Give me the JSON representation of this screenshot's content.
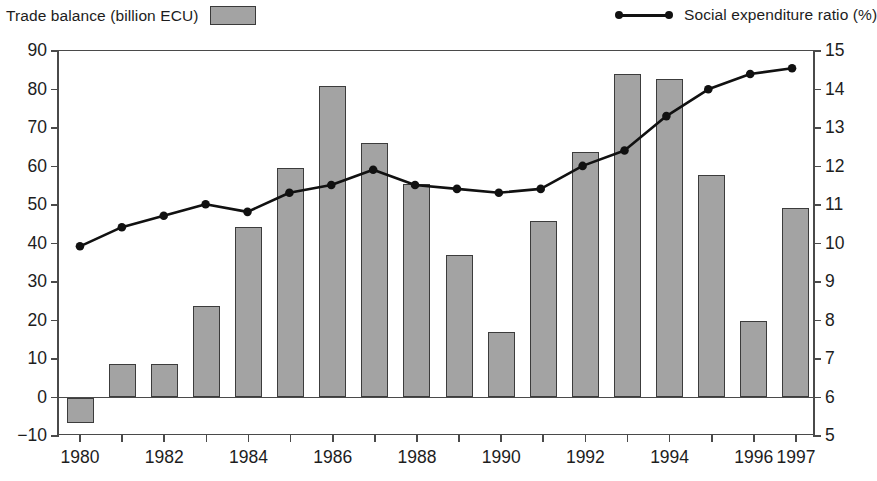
{
  "legend": {
    "bar": {
      "label": "Trade balance (billion ECU)",
      "swatch_icon": "gray-rectangle-swatch",
      "color": "#a3a3a3"
    },
    "line": {
      "label": "Social expenditure ratio (%)",
      "symbol_icon": "line-with-dots-symbol",
      "color": "#111111"
    }
  },
  "axes": {
    "left": {
      "ticks": [
        "90",
        "80",
        "70",
        "60",
        "50",
        "40",
        "30",
        "20",
        "10",
        "0",
        "−10"
      ],
      "min": -10,
      "max": 90,
      "step": 10
    },
    "right": {
      "ticks": [
        "15",
        "14",
        "13",
        "12",
        "11",
        "10",
        "9",
        "8",
        "7",
        "6",
        "5"
      ],
      "min": 5,
      "max": 15,
      "step": 1
    },
    "bottom": {
      "ticks": [
        "1980",
        "",
        "1982",
        "",
        "1984",
        "",
        "1986",
        "",
        "1988",
        "",
        "1990",
        "",
        "1992",
        "",
        "1994",
        "",
        "1996",
        "1997"
      ]
    }
  },
  "chart_data": {
    "type": "bar",
    "title": "",
    "xlabel": "",
    "grid": false,
    "legend_position": "top",
    "categories": [
      1980,
      1981,
      1982,
      1983,
      1984,
      1985,
      1986,
      1987,
      1988,
      1989,
      1990,
      1991,
      1992,
      1993,
      1994,
      1995,
      1996,
      1997
    ],
    "series": [
      {
        "name": "Trade balance (billion ECU)",
        "type": "bar",
        "axis": "left",
        "ylabel": "Trade balance (billion ECU)",
        "ylim": [
          -10,
          90
        ],
        "color": "#a3a3a3",
        "values": [
          -6.5,
          8.7,
          8.7,
          23.8,
          44.2,
          59.7,
          81.0,
          66.2,
          55.5,
          37.0,
          17.0,
          45.8,
          63.8,
          84.0,
          82.6,
          57.8,
          19.8,
          49.2
        ]
      },
      {
        "name": "Social expenditure ratio (%)",
        "type": "line",
        "axis": "right",
        "ylabel": "Social expenditure ratio (%)",
        "ylim": [
          5,
          15
        ],
        "color": "#111111",
        "values": [
          9.9,
          10.4,
          10.7,
          11.0,
          10.8,
          11.3,
          11.5,
          11.9,
          11.5,
          11.4,
          11.3,
          11.4,
          12.0,
          12.4,
          13.3,
          14.0,
          14.4,
          14.55
        ]
      }
    ]
  }
}
